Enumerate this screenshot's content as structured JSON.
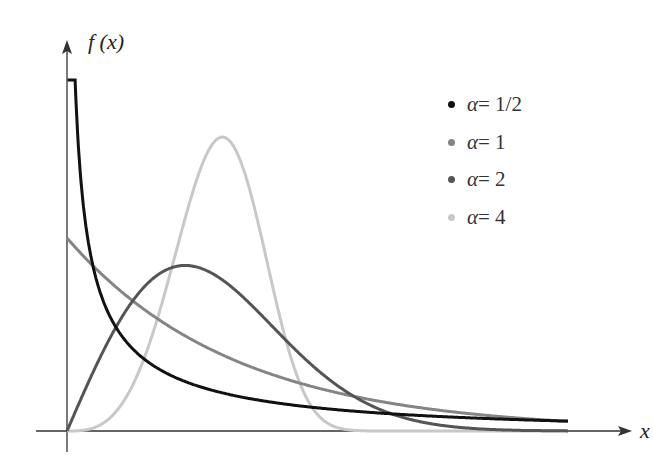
{
  "chart_data": {
    "type": "line",
    "title": "",
    "xlabel": "x",
    "ylabel": "f(x)",
    "function": "f(x) = alpha * x^(alpha-1) * exp(-x^alpha)",
    "xlim": [
      0,
      3
    ],
    "ylim": [
      0,
      1.85
    ],
    "grid": false,
    "legend_position": "upper right",
    "series": [
      {
        "name": "α = 1/2",
        "alpha": 0.5,
        "color": "#111111",
        "x": [
          0.02,
          0.1,
          0.25,
          0.5,
          1,
          1.5,
          2,
          2.5,
          3
        ],
        "values": [
          3.08,
          1.15,
          0.61,
          0.35,
          0.18,
          0.12,
          0.09,
          0.07,
          0.05
        ]
      },
      {
        "name": "α = 1",
        "alpha": 1,
        "color": "#858585",
        "x": [
          0,
          0.25,
          0.5,
          1,
          1.5,
          2,
          2.5,
          3
        ],
        "values": [
          1.0,
          0.78,
          0.61,
          0.37,
          0.22,
          0.14,
          0.08,
          0.05
        ]
      },
      {
        "name": "α = 2",
        "alpha": 2,
        "color": "#555555",
        "x": [
          0,
          0.25,
          0.5,
          0.707,
          1,
          1.5,
          2,
          2.5,
          3
        ],
        "values": [
          0,
          0.47,
          0.78,
          0.86,
          0.74,
          0.32,
          0.07,
          0.01,
          0.0
        ]
      },
      {
        "name": "α = 4",
        "alpha": 4,
        "color": "#c8c8c8",
        "x": [
          0,
          0.25,
          0.5,
          0.75,
          0.93,
          1,
          1.25,
          1.5,
          2,
          3
        ],
        "values": [
          0,
          0.06,
          0.47,
          1.23,
          1.57,
          1.47,
          0.43,
          0.02,
          0.0,
          0.0
        ]
      }
    ]
  },
  "axes": {
    "x_label": "x",
    "y_label": "f (x)"
  },
  "legend": [
    {
      "alpha_symbol": "α",
      "text": " = 1/2",
      "color": "#111111"
    },
    {
      "alpha_symbol": "α",
      "text": " = 1",
      "color": "#858585"
    },
    {
      "alpha_symbol": "α",
      "text": " = 2",
      "color": "#555555"
    },
    {
      "alpha_symbol": "α",
      "text": " = 4",
      "color": "#c8c8c8"
    }
  ]
}
